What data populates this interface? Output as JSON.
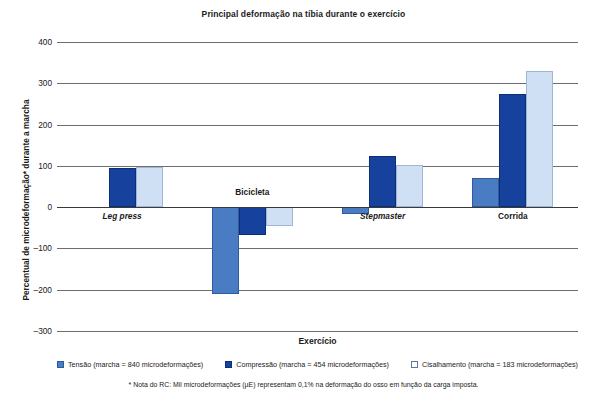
{
  "chart_data": {
    "type": "bar",
    "title": "Principal deformação na tíbia durante o exercício",
    "xlabel": "Exercício",
    "ylabel": "Percentual de microdeformação* durante a marcha",
    "categories": [
      "Leg press",
      "Bicicleta",
      "Stepmaster",
      "Corrida"
    ],
    "category_styles": [
      "italic",
      "bold",
      "italic",
      "bold"
    ],
    "series": [
      {
        "name": "Tensão (marcha = 840 microdeformações)",
        "short": "Tensão",
        "color": "#4a7cc4",
        "values": [
          0,
          -210,
          -17,
          70
        ]
      },
      {
        "name": "Compressão (marcha = 454 microdeformações)",
        "short": "Compressão",
        "color": "#16429e",
        "values": [
          95,
          -68,
          125,
          275
        ]
      },
      {
        "name": "Cisalhamento (marcha = 183 microdeformações)",
        "short": "Cisalhamento",
        "color": "#cfe0f4",
        "values": [
          97,
          -45,
          103,
          330
        ]
      }
    ],
    "ylim": [
      -300,
      400
    ],
    "yticks": [
      400,
      300,
      200,
      100,
      0,
      -100,
      -200,
      -300
    ],
    "ytick_labels": [
      "400",
      "300",
      "200",
      "100",
      "0",
      "–100",
      "–200",
      "–300"
    ],
    "grid": true,
    "legend_position": "bottom",
    "footnote": "* Nota do RC: Mil microdeformações (µE) representam 0,1% na deformação do osso em função da carga imposta."
  }
}
